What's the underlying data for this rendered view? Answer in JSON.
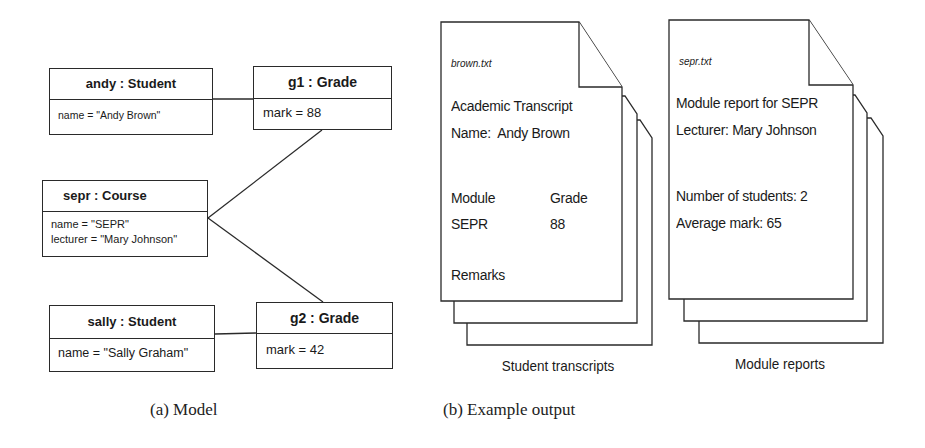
{
  "model": {
    "objects": {
      "andy": {
        "header": "andy : Student",
        "attrs": [
          "name = \"Andy Brown\""
        ]
      },
      "g1": {
        "header": "g1 : Grade",
        "attrs": [
          "mark = 88"
        ]
      },
      "sepr": {
        "header": "sepr : Course",
        "attrs": [
          "name = \"SEPR\"",
          "lecturer = \"Mary Johnson\""
        ]
      },
      "sally": {
        "header": "sally : Student",
        "attrs": [
          "name = \"Sally Graham\""
        ]
      },
      "g2": {
        "header": "g2 : Grade",
        "attrs": [
          "mark = 42"
        ]
      }
    },
    "links": [
      [
        "andy",
        "g1"
      ],
      [
        "sepr",
        "g1"
      ],
      [
        "sepr",
        "g2"
      ],
      [
        "sally",
        "g2"
      ]
    ]
  },
  "output": {
    "transcripts": {
      "filename": "brown.txt",
      "title": "Academic  Transcript",
      "name_line": "Name:  Andy Brown",
      "col_module": "Module",
      "col_grade": "Grade",
      "row_module": "SEPR",
      "row_grade": "88",
      "remarks": "Remarks",
      "label": "Student transcripts"
    },
    "reports": {
      "filename": "sepr.txt",
      "title": "Module report for SEPR",
      "lecturer_line": "Lecturer: Mary Johnson",
      "students_line": "Number of students: 2",
      "average_line": "Average mark: 65",
      "label": "Module reports"
    }
  },
  "captions": {
    "a": "(a) Model",
    "b": "(b) Example output"
  }
}
